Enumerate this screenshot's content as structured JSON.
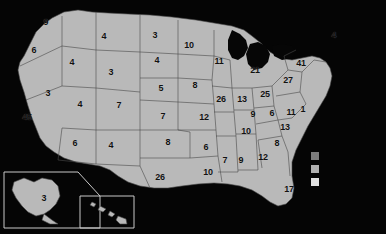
{
  "map": {
    "title": "United States choropleth map with per-state counts",
    "background_color": "#050505",
    "land_color": "#b9b9b9",
    "border_color": "#4a4a4a",
    "label_color": "#111111",
    "insets": [
      {
        "name": "alaska-inset",
        "label": "3"
      },
      {
        "name": "hawaii-inset",
        "label": ""
      }
    ],
    "legend": {
      "name": "legend",
      "swatches": [
        {
          "name": "legend-swatch-low",
          "color": "#7d7d7d"
        },
        {
          "name": "legend-swatch-mid",
          "color": "#b0b0b0"
        },
        {
          "name": "legend-swatch-high",
          "color": "#e2e2e2"
        }
      ]
    },
    "labels": [
      {
        "id": "WA",
        "value": "9",
        "x": 46,
        "y": 22
      },
      {
        "id": "OR",
        "value": "6",
        "x": 34,
        "y": 50
      },
      {
        "id": "ID",
        "value": "4",
        "x": 72,
        "y": 62
      },
      {
        "id": "MT",
        "value": "4",
        "x": 104,
        "y": 36
      },
      {
        "id": "NV",
        "value": "3",
        "x": 48,
        "y": 93
      },
      {
        "id": "CA",
        "value": "45",
        "x": 27,
        "y": 117
      },
      {
        "id": "UT",
        "value": "4",
        "x": 80,
        "y": 104
      },
      {
        "id": "WY",
        "value": "3",
        "x": 111,
        "y": 72
      },
      {
        "id": "CO",
        "value": "7",
        "x": 119,
        "y": 105
      },
      {
        "id": "AZ",
        "value": "6",
        "x": 75,
        "y": 143
      },
      {
        "id": "NM",
        "value": "4",
        "x": 111,
        "y": 145
      },
      {
        "id": "ND",
        "value": "3",
        "x": 155,
        "y": 35
      },
      {
        "id": "SD",
        "value": "4",
        "x": 157,
        "y": 60
      },
      {
        "id": "NE",
        "value": "5",
        "x": 161,
        "y": 88
      },
      {
        "id": "KS",
        "value": "7",
        "x": 163,
        "y": 116
      },
      {
        "id": "OK",
        "value": "8",
        "x": 168,
        "y": 142
      },
      {
        "id": "TX",
        "value": "26",
        "x": 160,
        "y": 177
      },
      {
        "id": "MN",
        "value": "10",
        "x": 189,
        "y": 45
      },
      {
        "id": "IA",
        "value": "8",
        "x": 195,
        "y": 85
      },
      {
        "id": "MO",
        "value": "12",
        "x": 204,
        "y": 117
      },
      {
        "id": "AR",
        "value": "6",
        "x": 206,
        "y": 147
      },
      {
        "id": "LA",
        "value": "10",
        "x": 208,
        "y": 172
      },
      {
        "id": "WI",
        "value": "11",
        "x": 219,
        "y": 61
      },
      {
        "id": "IL",
        "value": "26",
        "x": 221,
        "y": 99
      },
      {
        "id": "IN",
        "value": "13",
        "x": 242,
        "y": 99
      },
      {
        "id": "MI",
        "value": "21",
        "x": 255,
        "y": 70
      },
      {
        "id": "OH",
        "value": "25",
        "x": 265,
        "y": 94
      },
      {
        "id": "KY",
        "value": "9",
        "x": 253,
        "y": 114
      },
      {
        "id": "TN",
        "value": "10",
        "x": 246,
        "y": 131
      },
      {
        "id": "MS",
        "value": "7",
        "x": 225,
        "y": 160
      },
      {
        "id": "AL",
        "value": "9",
        "x": 241,
        "y": 160
      },
      {
        "id": "GA",
        "value": "12",
        "x": 263,
        "y": 157
      },
      {
        "id": "FL",
        "value": "17",
        "x": 289,
        "y": 189
      },
      {
        "id": "SC",
        "value": "8",
        "x": 277,
        "y": 143
      },
      {
        "id": "NC",
        "value": "13",
        "x": 285,
        "y": 127
      },
      {
        "id": "VA",
        "value": "11",
        "x": 291,
        "y": 112
      },
      {
        "id": "WV",
        "value": "6",
        "x": 272,
        "y": 113
      },
      {
        "id": "DC",
        "value": "1",
        "x": 303,
        "y": 109
      },
      {
        "id": "PA",
        "value": "41",
        "x": 301,
        "y": 63
      },
      {
        "id": "NY",
        "value": "27",
        "x": 288,
        "y": 80
      },
      {
        "id": "ME",
        "value": "4",
        "x": 334,
        "y": 35
      }
    ]
  }
}
